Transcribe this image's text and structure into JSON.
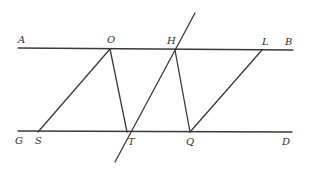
{
  "diagram": {
    "type": "geometry",
    "stroke_color": "#3a3a3a",
    "label_color": "#2e2e2e",
    "points": {
      "A": {
        "label": "A",
        "x": 18,
        "y": 48
      },
      "B": {
        "label": "B",
        "x": 293,
        "y": 50
      },
      "O": {
        "label": "O",
        "x": 110,
        "y": 49
      },
      "H": {
        "label": "H",
        "x": 175,
        "y": 50
      },
      "L": {
        "label": "L",
        "x": 262,
        "y": 50
      },
      "G": {
        "label": "G",
        "x": 18,
        "y": 131
      },
      "D": {
        "label": "D",
        "x": 292,
        "y": 132
      },
      "S": {
        "label": "S",
        "x": 38,
        "y": 132
      },
      "T": {
        "label": "T",
        "x": 127,
        "y": 132
      },
      "Q": {
        "label": "Q",
        "x": 190,
        "y": 132
      }
    },
    "segments": [
      {
        "name": "line-AB",
        "from": "A",
        "to": "B"
      },
      {
        "name": "line-GD",
        "from": "G",
        "to": "D"
      },
      {
        "name": "segment-OS",
        "from": "O",
        "to": "S"
      },
      {
        "name": "segment-OT",
        "from": "O",
        "to": "T"
      },
      {
        "name": "transversal-TH",
        "x1": 115,
        "y1": 162,
        "x2": 195,
        "y2": 13
      },
      {
        "name": "segment-HQ",
        "from": "H",
        "to": "Q"
      },
      {
        "name": "segment-QL",
        "from": "Q",
        "to": "L"
      }
    ],
    "labels": {
      "A": "A",
      "O": "O",
      "H": "H",
      "L": "L",
      "B": "B",
      "G": "G",
      "S": "S",
      "T": "T",
      "Q": "Q",
      "D": "D"
    }
  }
}
